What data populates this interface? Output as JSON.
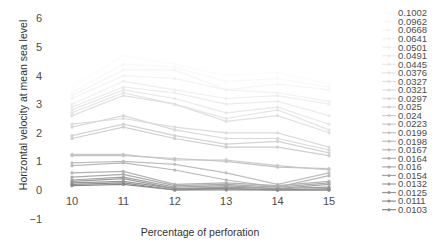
{
  "chart_data": {
    "type": "line",
    "title": "",
    "xlabel": "Percentage of perforation",
    "ylabel": "Horizontal velocity at mean sea level",
    "x": [
      10,
      11,
      12,
      13,
      14,
      15
    ],
    "xlim": [
      9.6,
      15.4
    ],
    "ylim": [
      -1,
      6
    ],
    "yticks": [
      -1,
      0,
      1,
      2,
      3,
      4,
      5,
      6
    ],
    "xticks": [
      10,
      11,
      12,
      13,
      14,
      15
    ],
    "grid": false,
    "legend_position": "right",
    "series": [
      {
        "name": "0.1002",
        "values": [
          3.6,
          4.7,
          4.4,
          4.0,
          4.1,
          3.7
        ],
        "color": "#fbfbfb"
      },
      {
        "name": "0.0962",
        "values": [
          3.4,
          4.4,
          4.3,
          3.8,
          3.9,
          3.6
        ],
        "color": "#f8f8f8"
      },
      {
        "name": "0.0668",
        "values": [
          3.3,
          4.2,
          4.2,
          3.5,
          3.7,
          3.5
        ],
        "color": "#f5f5f5"
      },
      {
        "name": "0.0641",
        "values": [
          3.2,
          4.0,
          3.9,
          3.5,
          3.4,
          3.1
        ],
        "color": "#f2f2f2"
      },
      {
        "name": "0.0501",
        "values": [
          3.0,
          3.8,
          3.5,
          3.2,
          3.3,
          3.0
        ],
        "color": "#efefef"
      },
      {
        "name": "0.0491",
        "values": [
          2.9,
          3.6,
          3.4,
          3.0,
          3.1,
          2.6
        ],
        "color": "#ececec"
      },
      {
        "name": "0.0445",
        "values": [
          2.8,
          3.5,
          3.2,
          2.7,
          2.9,
          2.3
        ],
        "color": "#e8e8e8"
      },
      {
        "name": "0.0376",
        "values": [
          2.7,
          3.4,
          3.0,
          2.5,
          2.8,
          2.1
        ],
        "color": "#e4e4e4"
      },
      {
        "name": "0.0327",
        "values": [
          2.6,
          3.3,
          3.0,
          2.4,
          2.6,
          2.0
        ],
        "color": "#e0e0e0"
      },
      {
        "name": "0.0321",
        "values": [
          2.3,
          2.5,
          2.2,
          2.0,
          2.0,
          1.5
        ],
        "color": "#dcdcdc"
      },
      {
        "name": "0.0297",
        "values": [
          2.2,
          2.6,
          2.1,
          1.8,
          1.8,
          1.4
        ],
        "color": "#d8d8d8"
      },
      {
        "name": "0.025",
        "values": [
          1.9,
          2.3,
          1.9,
          1.6,
          1.7,
          1.3
        ],
        "color": "#d3d3d3"
      },
      {
        "name": "0.024",
        "values": [
          1.8,
          2.2,
          1.8,
          1.5,
          1.5,
          1.2
        ],
        "color": "#cecece"
      },
      {
        "name": "0.0223",
        "values": [
          1.25,
          1.25,
          1.05,
          1.05,
          0.85,
          0.7
        ],
        "color": "#c9c9c9"
      },
      {
        "name": "0.0199",
        "values": [
          1.2,
          1.2,
          1.1,
          1.0,
          0.8,
          0.75
        ],
        "color": "#c4c4c4"
      },
      {
        "name": "0.0198",
        "values": [
          0.95,
          1.0,
          0.9,
          0.6,
          0.2,
          0.6
        ],
        "color": "#bebebe"
      },
      {
        "name": "0.0167",
        "values": [
          0.85,
          0.95,
          0.7,
          0.35,
          0.1,
          0.5
        ],
        "color": "#b8b8b8"
      },
      {
        "name": "0.0164",
        "values": [
          0.6,
          0.65,
          0.2,
          0.25,
          0.15,
          0.3
        ],
        "color": "#b2b2b2"
      },
      {
        "name": "0.016",
        "values": [
          0.45,
          0.55,
          0.15,
          0.2,
          0.1,
          0.25
        ],
        "color": "#ababab"
      },
      {
        "name": "0.0154",
        "values": [
          0.35,
          0.45,
          0.1,
          0.15,
          0.05,
          0.2
        ],
        "color": "#a4a4a4"
      },
      {
        "name": "0.0132",
        "values": [
          0.3,
          0.4,
          0.05,
          0.1,
          0.05,
          0.1
        ],
        "color": "#9d9d9d"
      },
      {
        "name": "0.0125",
        "values": [
          0.25,
          0.3,
          0.05,
          0.05,
          0.0,
          0.05
        ],
        "color": "#969696"
      },
      {
        "name": "0.0111",
        "values": [
          0.2,
          0.25,
          0.0,
          0.05,
          0.0,
          0.0
        ],
        "color": "#8f8f8f"
      },
      {
        "name": "0.0103",
        "values": [
          0.15,
          0.2,
          0.0,
          0.0,
          0.0,
          0.0
        ],
        "color": "#888888"
      }
    ]
  }
}
